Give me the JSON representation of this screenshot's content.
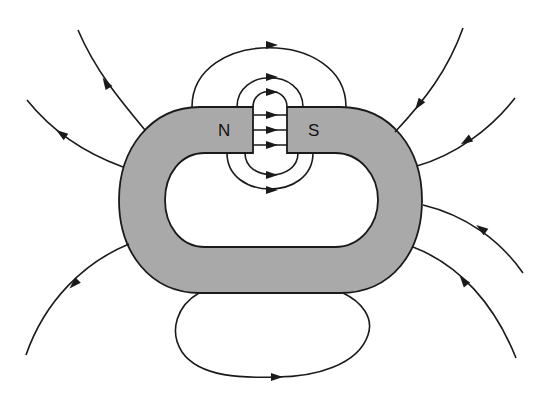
{
  "diagram": {
    "title": "",
    "poles": {
      "north_label": "N",
      "south_label": "S"
    },
    "colors": {
      "magnet_fill": "#a9a9a9",
      "line": "#1a1a1a",
      "background": "#ffffff"
    },
    "elements": {
      "magnet": "ring-shaped magnet with gap at top",
      "gap_field_arrows": 3,
      "gap_fringe_loops_top": 3,
      "gap_fringe_loops_bottom": 2,
      "external_bottom_loop": 1,
      "external_field_lines_left": 3,
      "external_field_lines_right": 4
    }
  }
}
